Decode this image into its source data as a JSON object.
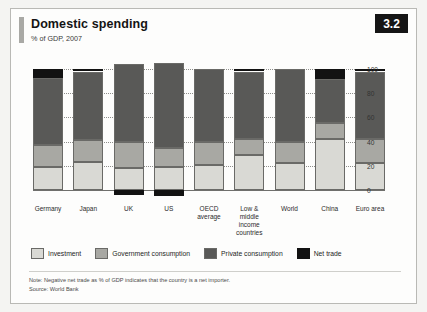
{
  "header": {
    "title": "Domestic spending",
    "subtitle": "% of GDP, 2007",
    "plate_number": "3.2"
  },
  "footer": {
    "note": "Note: Negative net trade as % of GDP indicates that the country is a net importer.",
    "source": "Source: World Bank"
  },
  "colors": {
    "investment": "#d9d9d4",
    "government": "#a8a8a3",
    "private": "#595957",
    "nettrade": "#121212",
    "plate_background": "#151515",
    "accent_bar": "#a9a9a5"
  },
  "chart_data": {
    "type": "bar",
    "stacked": true,
    "title": "Domestic spending",
    "subtitle": "% of GDP, 2007",
    "xlabel": "",
    "ylabel": "",
    "ylim": [
      -10,
      110
    ],
    "yticks": [
      0,
      20,
      40,
      60,
      80,
      100
    ],
    "grid": true,
    "legend_position": "bottom",
    "categories": [
      "Germany",
      "Japan",
      "UK",
      "US",
      "OECD\naverage",
      "Low & middle\nincome\ncountries",
      "World",
      "China",
      "Euro area"
    ],
    "series": [
      {
        "name": "Investment",
        "values": [
          19,
          23,
          18,
          19,
          21,
          29,
          22,
          42,
          22
        ]
      },
      {
        "name": "Government consumption",
        "values": [
          18,
          18,
          22,
          16,
          19,
          13,
          18,
          13,
          20
        ]
      },
      {
        "name": "Private consumption",
        "values": [
          56,
          57,
          64,
          70,
          60,
          56,
          60,
          37,
          56
        ]
      },
      {
        "name": "Net trade",
        "values": [
          7,
          2,
          -4,
          -5,
          0,
          2,
          0,
          8,
          2
        ]
      }
    ]
  }
}
